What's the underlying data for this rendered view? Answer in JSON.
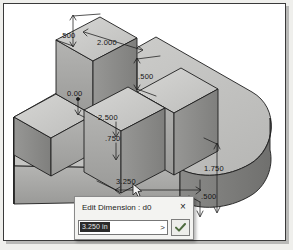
{
  "app": {
    "title": "CAD 3D model with dimension annotations",
    "viewport_bg": "#ffffff"
  },
  "model": {
    "description": "Isometric extruded base plate with rounded end and two vertical ribs",
    "face_colors": {
      "top": "#c9c9c7",
      "front": "#a8a8a6",
      "side": "#8f8f8d",
      "dark": "#6f6f6d",
      "edge": "#1d1d1d"
    }
  },
  "dimensions": [
    {
      "id": "d-500-top",
      "label": ".500",
      "x": 62,
      "y": 31
    },
    {
      "id": "d-2000",
      "label": "2.000",
      "x": 99,
      "y": 38
    },
    {
      "id": "d-500-mid",
      "label": ".500",
      "x": 140,
      "y": 72
    },
    {
      "id": "d-000",
      "label": "0.00",
      "x": 69,
      "y": 89
    },
    {
      "id": "d-2500",
      "label": "2.500",
      "x": 100,
      "y": 113
    },
    {
      "id": "d-750",
      "label": ".750",
      "x": 106,
      "y": 134
    },
    {
      "id": "d-1750",
      "label": "1.750",
      "x": 206,
      "y": 164
    },
    {
      "id": "d-500-right",
      "label": ".500",
      "x": 203,
      "y": 192
    },
    {
      "id": "d-3250",
      "label": "3.250",
      "x": 118,
      "y": 177
    }
  ],
  "cursor": {
    "x": 131,
    "y": 182,
    "icon": "arrow-pointer-icon"
  },
  "dialog": {
    "title": "Edit Dimension : d0",
    "close_label": "×",
    "close_icon": "close-icon",
    "input": {
      "value": "3.250 in",
      "placeholder": "",
      "selected": true,
      "dropdown_icon": ">",
      "dropdown_label": ">"
    },
    "ok_button": {
      "label": "",
      "icon": "check-icon",
      "color": "#4e6b3f"
    }
  }
}
